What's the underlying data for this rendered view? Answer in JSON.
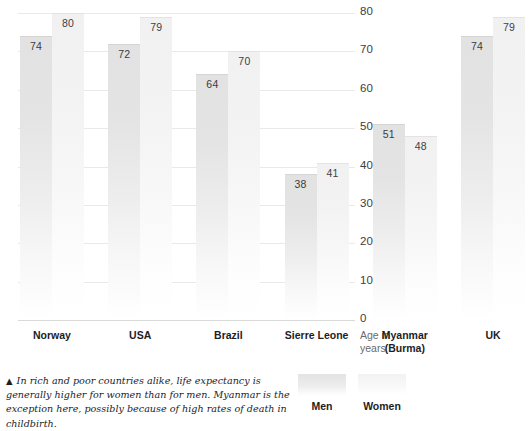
{
  "chart_data": {
    "type": "bar",
    "title": "",
    "xlabel": "",
    "ylabel": "Age in years",
    "ylim": [
      0,
      80
    ],
    "yticks": [
      80,
      70,
      60,
      50,
      40,
      30,
      20,
      10,
      0
    ],
    "grid": true,
    "legend_position": "bottom-right",
    "categories": [
      "Norway",
      "USA",
      "Brazil",
      "Sierre Leone",
      "Myanmar (Burma)",
      "UK"
    ],
    "series": [
      {
        "name": "Men",
        "values": [
          74,
          72,
          64,
          38,
          51,
          74
        ],
        "color": "#e2e2e3"
      },
      {
        "name": "Women",
        "values": [
          80,
          79,
          70,
          41,
          48,
          79
        ],
        "color": "#f1f1f2"
      }
    ]
  },
  "axis": {
    "y_title_line1": "Age in",
    "y_title_line2": "years",
    "ticks": [
      {
        "label": "80",
        "value": 80
      },
      {
        "label": "70",
        "value": 70
      },
      {
        "label": "60",
        "value": 60
      },
      {
        "label": "50",
        "value": 50
      },
      {
        "label": "40",
        "value": 40
      },
      {
        "label": "30",
        "value": 30
      },
      {
        "label": "20",
        "value": 20
      },
      {
        "label": "10",
        "value": 10
      },
      {
        "label": "0",
        "value": 0
      }
    ]
  },
  "groups": [
    {
      "name": "Norway",
      "label_line1": "Norway",
      "label_line2": "",
      "men": "74",
      "women": "80"
    },
    {
      "name": "USA",
      "label_line1": "USA",
      "label_line2": "",
      "men": "72",
      "women": "79"
    },
    {
      "name": "Brazil",
      "label_line1": "Brazil",
      "label_line2": "",
      "men": "64",
      "women": "70"
    },
    {
      "name": "Sierre Leone",
      "label_line1": "Sierre Leone",
      "label_line2": "",
      "men": "38",
      "women": "41"
    },
    {
      "name": "Myanmar (Burma)",
      "label_line1": "Myanmar",
      "label_line2": "(Burma)",
      "men": "51",
      "women": "48"
    },
    {
      "name": "UK",
      "label_line1": "UK",
      "label_line2": "",
      "men": "74",
      "women": "79"
    }
  ],
  "legend": {
    "men_label": "Men",
    "women_label": "Women"
  },
  "caption": {
    "marker": "▲",
    "text": "In rich and poor countries alike, life expectancy is generally higher for women than for men. Myanmar is the exception here, possibly because of high rates of death in childbirth."
  }
}
